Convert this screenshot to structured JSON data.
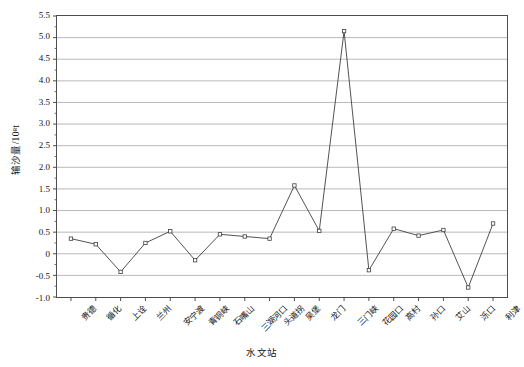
{
  "chart_data": {
    "type": "line",
    "title": "",
    "xlabel": "水文站",
    "ylabel": "输沙量/10⁸t",
    "categories": [
      "贵德",
      "循化",
      "上诠",
      "兰州",
      "安宁渡",
      "青铜峡",
      "石嘴山",
      "三湖河口",
      "头道拐",
      "吴堡",
      "龙门",
      "三门峡",
      "花园口",
      "高村",
      "孙口",
      "艾山",
      "泺口",
      "利津"
    ],
    "values": [
      0.35,
      0.22,
      -0.42,
      0.25,
      0.52,
      -0.15,
      0.45,
      0.4,
      0.35,
      1.58,
      0.53,
      5.15,
      -0.38,
      0.58,
      0.42,
      0.55,
      -0.78,
      0.7
    ],
    "ylim": [
      -1.0,
      5.5
    ],
    "yticks": [
      "5.5",
      "5.0",
      "4.5",
      "4.0",
      "3.5",
      "3.0",
      "2.5",
      "2.0",
      "1.5",
      "1.0",
      "0.5",
      "0",
      "-0.5",
      "-1.0"
    ],
    "ytick_values": [
      5.5,
      5.0,
      4.5,
      4.0,
      3.5,
      3.0,
      2.5,
      2.0,
      1.5,
      1.0,
      0.5,
      0,
      -0.5,
      -1.0
    ],
    "grid": true,
    "legend": "none",
    "marker": "open-square",
    "line_color": "#3f3f3f",
    "marker_color": "#3f3f3f",
    "grid_color": "#9a9a9a",
    "axis_color": "#4d4d4d"
  }
}
